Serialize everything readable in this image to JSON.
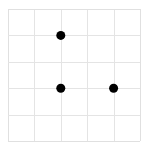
{
  "grid": {
    "origin_px": [
      8,
      9
    ],
    "cell_px": 26.4,
    "cols": 5,
    "rows": 5,
    "line_color": "#e4e4e4",
    "border_color": "#e0e0e0"
  },
  "points": [
    {
      "label": "A",
      "col": 2,
      "row": 1,
      "color": "#000000"
    },
    {
      "label": "B",
      "col": 2,
      "row": 3,
      "color": "#000000"
    },
    {
      "label": "C",
      "col": 4,
      "row": 3,
      "color": "#000000"
    }
  ],
  "point_radius_px": 4.5
}
